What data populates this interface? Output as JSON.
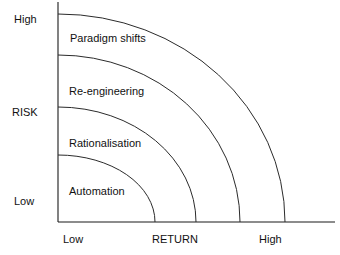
{
  "diagram": {
    "axes": {
      "y": {
        "title": "RISK",
        "title_pos": {
          "x": 12,
          "y": 106
        },
        "low_label": "Low",
        "low_pos": {
          "x": 14,
          "y": 195
        },
        "high_label": "High",
        "high_pos": {
          "x": 14,
          "y": 13
        },
        "line": {
          "x": 58,
          "y1": 2,
          "y2": 222
        }
      },
      "x": {
        "title": "RETURN",
        "title_pos": {
          "x": 152,
          "y": 233
        },
        "low_label": "Low",
        "low_pos": {
          "x": 63,
          "y": 233
        },
        "high_label": "High",
        "high_pos": {
          "x": 259,
          "y": 233
        },
        "line": {
          "y": 222,
          "x1": 58,
          "x2": 335
        }
      }
    },
    "origin": {
      "x": 58,
      "y": 222
    },
    "zones": [
      {
        "label": "Automation",
        "label_pos": {
          "x": 69,
          "y": 185
        },
        "arc_rx": 97,
        "arc_ry": 67,
        "risk_level": "Low",
        "return_level": "Low"
      },
      {
        "label": "Rationalisation",
        "label_pos": {
          "x": 69,
          "y": 137
        },
        "arc_rx": 138,
        "arc_ry": 115,
        "risk_level": "Low-Medium",
        "return_level": "Medium"
      },
      {
        "label": "Re-engineering",
        "label_pos": {
          "x": 69,
          "y": 85
        },
        "arc_rx": 182,
        "arc_ry": 167,
        "risk_level": "Medium-High",
        "return_level": "Medium-High"
      },
      {
        "label": "Paradigm shifts",
        "label_pos": {
          "x": 70,
          "y": 32
        },
        "arc_rx": 227,
        "arc_ry": 208,
        "risk_level": "High",
        "return_level": "High"
      }
    ],
    "colors": {
      "line": "#2b2b2b",
      "axis": "#1a1a1a",
      "text": "#111111",
      "background": "#ffffff"
    }
  },
  "chart_data": {
    "type": "diagram",
    "xlabel": "RETURN",
    "ylabel": "RISK",
    "x_ticks": [
      "Low",
      "High"
    ],
    "y_ticks": [
      "Low",
      "High"
    ],
    "bands": [
      {
        "name": "Automation",
        "risk": "Low",
        "return": "Low",
        "order": 1
      },
      {
        "name": "Rationalisation",
        "risk": "Low-Medium",
        "return": "Medium",
        "order": 2
      },
      {
        "name": "Re-engineering",
        "risk": "Medium-High",
        "return": "Medium-High",
        "order": 3
      },
      {
        "name": "Paradigm shifts",
        "risk": "High",
        "return": "High",
        "order": 4
      }
    ],
    "grid": false,
    "legend": "none"
  }
}
